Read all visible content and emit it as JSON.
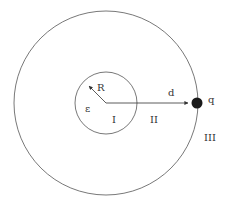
{
  "diagram": {
    "outer_circle": {
      "cx": 106,
      "cy": 103,
      "r": 92
    },
    "inner_circle": {
      "cx": 106,
      "cy": 103,
      "r": 31
    },
    "charge": {
      "cx": 195,
      "cy": 103,
      "r": 5,
      "color": "#1a1a1a"
    },
    "line_color": "#555555",
    "labels": {
      "radius": "R",
      "permittivity": "ε",
      "distance": "d",
      "charge": "q",
      "region_1": "I",
      "region_2": "II",
      "region_3": "III"
    }
  }
}
